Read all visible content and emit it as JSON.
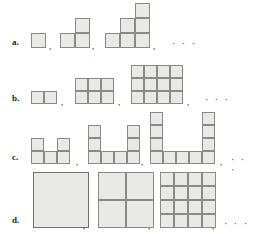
{
  "figure": {
    "background": "#ffffff",
    "cell_fill": "#e9e9e6",
    "cell_stroke": "#8a8a8a",
    "separator": ",",
    "ellipsis": "· · ·"
  },
  "rows": [
    {
      "label": "a.",
      "y": 4,
      "baseline": 48,
      "description": "staircase polyomino sequence",
      "label_x": 12,
      "label_y": 38,
      "items": [
        {
          "x": 31,
          "cols": 1,
          "rows": 1,
          "cellsize": 15,
          "cells": [
            [
              0,
              0
            ]
          ]
        },
        {
          "x": 60,
          "cols": 2,
          "rows": 2,
          "cellsize": 15,
          "cells": [
            [
              0,
              1
            ],
            [
              1,
              0
            ],
            [
              1,
              1
            ]
          ]
        },
        {
          "x": 105,
          "cols": 3,
          "rows": 3,
          "cellsize": 15,
          "cells": [
            [
              0,
              2
            ],
            [
              1,
              1
            ],
            [
              1,
              2
            ],
            [
              2,
              0
            ],
            [
              2,
              1
            ],
            [
              2,
              2
            ]
          ]
        }
      ],
      "separators_x": [
        49,
        92,
        153
      ],
      "ellipsis_x": 172
    },
    {
      "label": "b.",
      "y": 62,
      "baseline": 104,
      "description": "n by (n+1) rectangle sequence",
      "label_x": 12,
      "label_y": 94,
      "items": [
        {
          "x": 31,
          "cols": 2,
          "rows": 1,
          "cellsize": 13
        },
        {
          "x": 75,
          "cols": 3,
          "rows": 2,
          "cellsize": 13
        },
        {
          "x": 131,
          "cols": 4,
          "rows": 3,
          "cellsize": 13
        }
      ],
      "separators_x": [
        61,
        118,
        187
      ],
      "ellipsis_x": 205
    },
    {
      "label": "c.",
      "y": 114,
      "baseline": 164,
      "description": "U-shape sequence",
      "label_x": 12,
      "label_y": 153,
      "items": [
        {
          "x": 31,
          "cols": 3,
          "rows": 2,
          "cellsize": 13,
          "notch": 1
        },
        {
          "x": 88,
          "cols": 4,
          "rows": 3,
          "cellsize": 13,
          "notch": 2
        },
        {
          "x": 150,
          "cols": 5,
          "rows": 4,
          "cellsize": 13,
          "notch": 3
        }
      ],
      "separators_x": [
        76,
        141,
        220
      ],
      "ellipsis_x": 231
    },
    {
      "label": "d.",
      "y": 172,
      "baseline": 228,
      "description": "unit square subdivided into n by n grid",
      "label_x": 12,
      "label_y": 216,
      "items": [
        {
          "x": 33,
          "size": 56,
          "divisions": 1
        },
        {
          "x": 98,
          "size": 56,
          "divisions": 2
        },
        {
          "x": 160,
          "size": 56,
          "divisions": 4
        }
      ],
      "separators_x": [
        83,
        148,
        212
      ],
      "ellipsis_x": 224
    }
  ]
}
